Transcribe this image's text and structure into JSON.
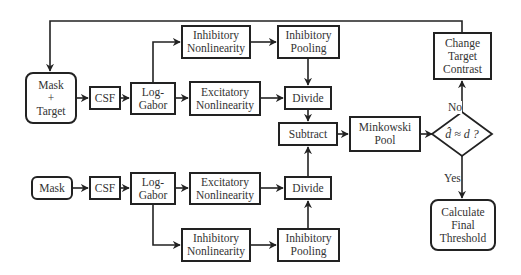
{
  "diagram": {
    "title": "",
    "top_path": {
      "mask_target": "Mask + Target",
      "mask_target_lines": [
        "Mask",
        "+",
        "Target"
      ],
      "csf": "CSF",
      "log_gabor_lines": [
        "Log-",
        "Gabor"
      ],
      "inhibitory_nonlinearity_lines": [
        "Inhibitory",
        "Nonlinearity"
      ],
      "excitatory_nonlinearity_lines": [
        "Excitatory",
        "Nonlinearity"
      ],
      "inhibitory_pooling_lines": [
        "Inhibitory",
        "Pooling"
      ],
      "divide": "Divide"
    },
    "bottom_path": {
      "mask": "Mask",
      "csf": "CSF",
      "log_gabor_lines": [
        "Log-",
        "Gabor"
      ],
      "excitatory_nonlinearity_lines": [
        "Excitatory",
        "Nonlinearity"
      ],
      "inhibitory_nonlinearity_lines": [
        "Inhibitory",
        "Nonlinearity"
      ],
      "inhibitory_pooling_lines": [
        "Inhibitory",
        "Pooling"
      ],
      "divide": "Divide"
    },
    "subtract": "Subtract",
    "minkowski_pool_lines": [
      "Minkowski",
      "Pool"
    ],
    "decision": "d̂ ≈ d ?",
    "change_target_contrast_lines": [
      "Change",
      "Target",
      "Contrast"
    ],
    "calculate_final_threshold_lines": [
      "Calculate",
      "Final",
      "Threshold"
    ],
    "edge_labels": {
      "no": "No",
      "yes": "Yes"
    },
    "colors": {
      "stroke": "#222222",
      "text": "#333333",
      "background": "#ffffff"
    }
  }
}
